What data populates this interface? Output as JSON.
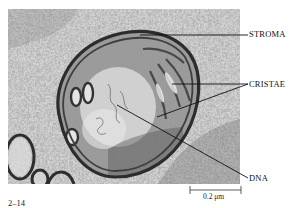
{
  "figure": {
    "number": "2–14",
    "type": "electron micrograph",
    "labels": [
      {
        "id": "stroma",
        "text": "STROMA"
      },
      {
        "id": "cristae",
        "text": "CRISTAE"
      },
      {
        "id": "dna",
        "text": "DNA"
      }
    ],
    "scale_bar": {
      "text": "0.2 μm"
    },
    "colors": {
      "background": "#ffffff",
      "leader_line": "#111111",
      "micrograph_base": "#b8b8b8",
      "membrane_dark": "#3a3a3a",
      "matrix_light": "#d8d8d8"
    }
  }
}
